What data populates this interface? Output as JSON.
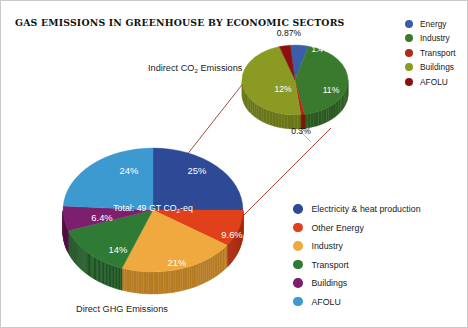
{
  "title": "GAS EMISSIONS IN GREENHOUSE BY  ECONOMIC SECTORS",
  "captions": {
    "top_pie": "Indirect CO₂ Emissions",
    "bottom_pie": "Direct GHG Emissions"
  },
  "main_total_label": "Total: 49 GT CO₂-eq",
  "legend_top": {
    "items": [
      {
        "label": "Energy",
        "color": "#3a5fa8"
      },
      {
        "label": "Industry",
        "color": "#3a7a2e"
      },
      {
        "label": "Transport",
        "color": "#b02a16"
      },
      {
        "label": "Buildings",
        "color": "#8b9a22"
      },
      {
        "label": "AFOLU",
        "color": "#8c1010"
      }
    ]
  },
  "legend_bottom": {
    "items": [
      {
        "label": "Electricity & heat production",
        "color": "#2e4a96"
      },
      {
        "label": "Other Energy",
        "color": "#e0401a"
      },
      {
        "label": "Industry",
        "color": "#efa93f"
      },
      {
        "label": "Transport",
        "color": "#2f7a35"
      },
      {
        "label": "Buildings",
        "color": "#7b1f6e"
      },
      {
        "label": "AFOLU",
        "color": "#3d9ad1"
      }
    ]
  },
  "chart_data": [
    {
      "type": "pie",
      "title": "Direct GHG Emissions",
      "annotation": "Total: 49 GT CO₂-eq",
      "categories": [
        "Electricity & heat production",
        "Other Energy",
        "Industry",
        "Transport",
        "Buildings",
        "AFOLU"
      ],
      "values": [
        25,
        9.6,
        21,
        14,
        6.4,
        24
      ],
      "labels": [
        "25%",
        "9.6%",
        "21%",
        "14%",
        "6.4%",
        "24%"
      ],
      "colors": [
        "#2e4a96",
        "#e0401a",
        "#efa93f",
        "#2f7a35",
        "#7b1f6e",
        "#3d9ad1"
      ],
      "unit": "%",
      "legend_position": "right"
    },
    {
      "type": "pie",
      "title": "Indirect CO₂ Emissions",
      "categories": [
        "Energy",
        "Industry",
        "Transport",
        "Buildings",
        "AFOLU"
      ],
      "values": [
        1.4,
        11,
        0.3,
        12,
        0.87
      ],
      "labels": [
        "1.4%",
        "11%",
        "0.3%",
        "12%",
        "0.87%"
      ],
      "colors": [
        "#3a5fa8",
        "#3a7a2e",
        "#b02a16",
        "#8b9a22",
        "#8c1010"
      ],
      "unit": "%",
      "legend_position": "top-right"
    }
  ],
  "main_pie": {
    "slices": [
      {
        "label": "25%",
        "color": "#2e4a96",
        "side": "#20356d",
        "value": 25,
        "lx": 196,
        "ly": 169
      },
      {
        "label": "9.6%",
        "color": "#e0401a",
        "side": "#a92c0f",
        "value": 9.6,
        "lx": 231,
        "ly": 233
      },
      {
        "label": "21%",
        "color": "#efa93f",
        "side": "#b87c23",
        "value": 21,
        "lx": 176,
        "ly": 261
      },
      {
        "label": "14%",
        "color": "#2f7a35",
        "side": "#1f5624",
        "value": 14,
        "lx": 117,
        "ly": 248
      },
      {
        "label": "6.4%",
        "color": "#7b1f6e",
        "side": "#581349",
        "value": 6.4,
        "lx": 101,
        "ly": 216
      },
      {
        "label": "24%",
        "color": "#3d9ad1",
        "side": "#2b74a1",
        "value": 24,
        "lx": 128,
        "ly": 169
      }
    ]
  },
  "small_pie": {
    "slices": [
      {
        "label": "1.4%",
        "color": "#3a5fa8",
        "side": "#2a4780",
        "value": 1.4,
        "lx": 320,
        "ly": 48,
        "pos": "inside"
      },
      {
        "label": "11%",
        "color": "#3a7a2e",
        "side": "#2a5a21",
        "value": 11,
        "lx": 330,
        "ly": 89,
        "pos": "inside"
      },
      {
        "label": "0.3%",
        "color": "#b02a16",
        "side": "#851f10",
        "value": 0.3,
        "lx": 300,
        "ly": 130,
        "pos": "outside"
      },
      {
        "label": "12%",
        "color": "#8b9a22",
        "side": "#6a7619",
        "value": 12,
        "lx": 282,
        "ly": 88,
        "pos": "inside"
      },
      {
        "label": "0.87%",
        "color": "#8c1010",
        "side": "#6a0c0c",
        "value": 0.87,
        "lx": 288,
        "ly": 32,
        "pos": "outside"
      }
    ]
  }
}
